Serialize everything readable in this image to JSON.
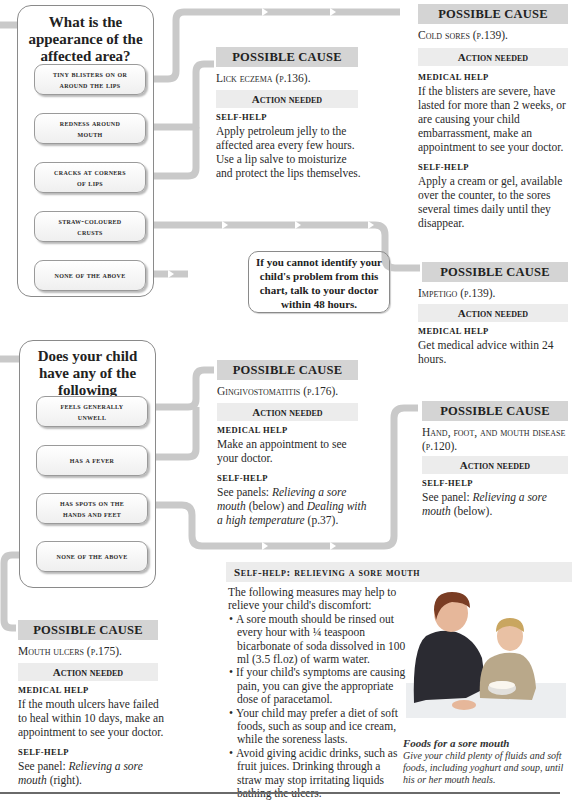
{
  "colors": {
    "connector": "#c9c9c9",
    "possible_cause_bg": "#d4d4d4",
    "action_needed_bg": "#ececec",
    "panel_border": "#8a8a8a"
  },
  "question1": {
    "title_lines": [
      "What is the",
      "appearance of the",
      "affected area?"
    ],
    "options": [
      {
        "line1": "Tiny blisters on or",
        "line2": "around the lips"
      },
      {
        "line1": "Redness around",
        "line2": "mouth"
      },
      {
        "line1": "Cracks at corners",
        "line2": "of lips"
      },
      {
        "line1": "Straw-coloured",
        "line2": "crusts"
      },
      {
        "line1": "None of the above",
        "line2": ""
      }
    ]
  },
  "cause_cold_sores": {
    "header": "POSSIBLE CAUSE",
    "cause": "Cold sores (p.139).",
    "action_header": "Action needed",
    "medical_label": "MEDICAL HELP",
    "medical_text": "If the blisters are severe, have lasted for more than 2 weeks, or are causing your child embarrassment, make an appointment to see your doctor.",
    "self_label": "SELF-HELP",
    "self_text": "Apply a cream or gel, available over the counter, to the sores several times daily until they disappear."
  },
  "cause_lick_eczema": {
    "header": "POSSIBLE CAUSE",
    "cause": "Lick eczema (p.136).",
    "action_header": "Action needed",
    "self_label": "SELF-HELP",
    "self_text": "Apply petroleum jelly to the affected area every few hours. Use a lip salve to moisturize and protect the lips themselves."
  },
  "note": {
    "text": "If you cannot identify your child's problem from this chart, talk to your doctor within 48 hours."
  },
  "cause_impetigo": {
    "header": "POSSIBLE CAUSE",
    "cause": "Impetigo (p.139).",
    "action_header": "Action needed",
    "medical_label": "MEDICAL HELP",
    "medical_text": "Get medical advice within 24 hours."
  },
  "question2": {
    "title_lines": [
      "Does your child",
      "have any of the",
      "following symptoms?"
    ],
    "options": [
      {
        "line1": "Feels generally",
        "line2": "unwell"
      },
      {
        "line1": "Has a fever",
        "line2": ""
      },
      {
        "line1": "Has spots on the",
        "line2": "hands and feet"
      },
      {
        "line1": "None of the above",
        "line2": ""
      }
    ]
  },
  "cause_gingivostomatitis": {
    "header": "POSSIBLE CAUSE",
    "cause": "Gingivostomatitis (p.176).",
    "action_header": "Action needed",
    "medical_label": "MEDICAL HELP",
    "medical_text": "Make an appointment to see your doctor.",
    "self_label": "SELF-HELP",
    "self_pre": "See panels: ",
    "self_link1": "Relieving a sore mouth",
    "self_mid": " (below) and ",
    "self_link2": "Dealing with a high temperature",
    "self_post": " (p.37)."
  },
  "cause_hfmd": {
    "header": "POSSIBLE CAUSE",
    "cause": "Hand, foot, and mouth disease (p.120).",
    "action_header": "Action needed",
    "self_label": "SELF-HELP",
    "self_pre": "See panel: ",
    "self_link": "Relieving a sore mouth",
    "self_post": " (below)."
  },
  "cause_mouth_ulcers": {
    "header": "POSSIBLE CAUSE",
    "cause": "Mouth ulcers (p.175).",
    "action_header": "Action needed",
    "medical_label": "MEDICAL HELP",
    "medical_text": "If the mouth ulcers have failed to heal within 10 days, make an appointment to see your doctor.",
    "self_label": "SELF-HELP",
    "self_pre": "See panel: ",
    "self_link": "Relieving a sore mouth",
    "self_post": " (right)."
  },
  "self_help_panel": {
    "title": "Self-help: relieving a sore mouth",
    "intro": "The following measures may help to relieve your child's discomfort:",
    "bullets": [
      "A sore mouth should be rinsed out every hour with ¼ teaspoon bicarbonate of soda dissolved in 100 ml (3.5 fl.oz) of warm water.",
      "If your child's symptoms are causing pain, you can give the appropriate dose of paracetamol.",
      "Your child may prefer a diet of soft foods, such as soup and ice cream, while the soreness lasts.",
      "Avoid giving acidic drinks, such as fruit juices. Drinking through a straw may stop irritating liquids bathing the ulcers."
    ],
    "photo_caption_title": "Foods for a sore mouth",
    "photo_caption_text": "Give your child plenty of fluids and soft foods, including yoghurt and soup, until his or her mouth heals."
  }
}
